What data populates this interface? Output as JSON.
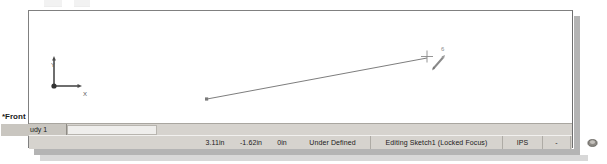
{
  "window": {
    "app": "SolidWorks Sketch Window"
  },
  "graphics": {
    "origin": {
      "x_axis_label": "X",
      "y_axis_label": "Y"
    },
    "cursor": {
      "badge_label": "6",
      "crosshair_icon": "crosshair-icon",
      "pencil_icon": "pencil-icon"
    },
    "sketch": {
      "line_icon": "sketch-line"
    }
  },
  "view_label": {
    "text": "*Front"
  },
  "tabs": {
    "active_label": "udy 1"
  },
  "status": {
    "coord_x": "3.11in",
    "coord_y": "-1.62in",
    "coord_z": "0in",
    "state": "Under Defined",
    "edit_mode": "Editing Sketch1 (Locked Focus)",
    "units": "IPS",
    "mini_label": "-",
    "indicator_icon": "graphics-indicator-icon"
  },
  "colors": {
    "window_chrome": "#d6d3ce",
    "canvas": "#ffffff",
    "sketch_line": "#6e6e6e",
    "origin_marker": "#404040",
    "tab_active": "#c9c6c0",
    "shadow": "#b4b4b4"
  }
}
